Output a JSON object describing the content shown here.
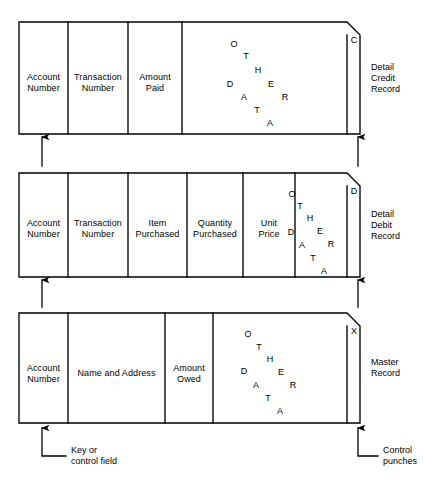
{
  "diagram": {
    "stroke_color": "#000000",
    "background_color": "#ffffff",
    "records": [
      {
        "id": "detail-credit-record",
        "side_label": "Detail\nCredit\nRecord",
        "flag_letter": "C",
        "box": {
          "x": 19,
          "y": 22,
          "width": 341,
          "height": 112,
          "corner_cut": 13
        },
        "divider_x": [
          68,
          128,
          182,
          347
        ],
        "cells": [
          {
            "name": "account-number",
            "label": "Account\nNumber",
            "cx": 43.5,
            "cy": 82
          },
          {
            "name": "transaction-number",
            "label": "Transaction\nNumber",
            "cx": 98,
            "cy": 82
          },
          {
            "name": "amount-paid",
            "label": "Amount\nPaid",
            "cx": 155,
            "cy": 82
          },
          {
            "name": "other-data",
            "label": "OTHER DATA",
            "cx": 265,
            "cy": 78
          }
        ],
        "scatter": {
          "letters": [
            {
              "ch": "O",
              "x": 234,
              "y": 44
            },
            {
              "ch": "T",
              "x": 246,
              "y": 56
            },
            {
              "ch": "H",
              "x": 258,
              "y": 70
            },
            {
              "ch": "E",
              "x": 271,
              "y": 84
            },
            {
              "ch": "R",
              "x": 285,
              "y": 97
            },
            {
              "ch": "D",
              "x": 230,
              "y": 84
            },
            {
              "ch": "A",
              "x": 244,
              "y": 97
            },
            {
              "ch": "T",
              "x": 257,
              "y": 110
            },
            {
              "ch": "A",
              "x": 270,
              "y": 123
            }
          ]
        }
      },
      {
        "id": "detail-debit-record",
        "side_label": "Detail\nDebit\nRecord",
        "flag_letter": "D",
        "box": {
          "x": 19,
          "y": 173,
          "width": 341,
          "height": 104,
          "corner_cut": 13
        },
        "divider_x": [
          68,
          128,
          187,
          243,
          295,
          347
        ],
        "cells": [
          {
            "name": "account-number",
            "label": "Account\nNumber",
            "cx": 43.5,
            "cy": 228
          },
          {
            "name": "transaction-number",
            "label": "Transaction\nNumber",
            "cx": 98,
            "cy": 228
          },
          {
            "name": "item-purchased",
            "label": "Item\nPurchased",
            "cx": 157.5,
            "cy": 228
          },
          {
            "name": "quantity-purchased",
            "label": "Quantity\nPurchased",
            "cx": 215,
            "cy": 228
          },
          {
            "name": "unit-price",
            "label": "Unit\nPrice",
            "cx": 269,
            "cy": 228
          },
          {
            "name": "other-data",
            "label": "OTHER DATA",
            "cx": 320,
            "cy": 225
          }
        ],
        "scatter": {
          "letters": [
            {
              "ch": "O",
              "x": 292,
              "y": 194
            },
            {
              "ch": "T",
              "x": 300,
              "y": 206
            },
            {
              "ch": "H",
              "x": 310,
              "y": 218
            },
            {
              "ch": "E",
              "x": 320,
              "y": 231
            },
            {
              "ch": "R",
              "x": 331,
              "y": 244
            },
            {
              "ch": "D",
              "x": 291,
              "y": 232
            },
            {
              "ch": "A",
              "x": 302,
              "y": 245
            },
            {
              "ch": "T",
              "x": 313,
              "y": 258
            },
            {
              "ch": "A",
              "x": 324,
              "y": 271
            }
          ]
        }
      },
      {
        "id": "master-record",
        "side_label": "Master\nRecord",
        "flag_letter": "X",
        "box": {
          "x": 19,
          "y": 313,
          "width": 341,
          "height": 110,
          "corner_cut": 13
        },
        "divider_x": [
          68,
          165,
          213,
          347
        ],
        "cells": [
          {
            "name": "account-number",
            "label": "Account\nNumber",
            "cx": 43.5,
            "cy": 373
          },
          {
            "name": "name-and-address",
            "label": "Name and Address",
            "cx": 116.5,
            "cy": 373
          },
          {
            "name": "amount-owed",
            "label": "Amount\nOwed",
            "cx": 189,
            "cy": 373
          },
          {
            "name": "other-data",
            "label": "OTHER DATA",
            "cx": 280,
            "cy": 371
          }
        ],
        "scatter": {
          "letters": [
            {
              "ch": "O",
              "x": 248,
              "y": 334
            },
            {
              "ch": "T",
              "x": 259,
              "y": 347
            },
            {
              "ch": "H",
              "x": 270,
              "y": 359
            },
            {
              "ch": "E",
              "x": 281,
              "y": 372
            },
            {
              "ch": "R",
              "x": 293,
              "y": 385
            },
            {
              "ch": "D",
              "x": 244,
              "y": 371
            },
            {
              "ch": "A",
              "x": 256,
              "y": 385
            },
            {
              "ch": "T",
              "x": 268,
              "y": 398
            },
            {
              "ch": "A",
              "x": 280,
              "y": 411
            }
          ]
        }
      }
    ],
    "side_labels": [
      {
        "name": "side-label-detail-credit-record",
        "lines": [
          "Detail",
          "Credit",
          "Record"
        ],
        "x": 371,
        "y": 78
      },
      {
        "name": "side-label-detail-debit-record",
        "lines": [
          "Detail",
          "Debit",
          "Record"
        ],
        "x": 371,
        "y": 225
      },
      {
        "name": "side-label-master-record",
        "lines": [
          "Master",
          "Record"
        ],
        "x": 371,
        "y": 368
      }
    ],
    "connector_arrows": [
      {
        "name": "arrow-account-number-debit-to-credit",
        "x": 42,
        "y_from": 166,
        "y_to": 137
      },
      {
        "name": "arrow-control-punch-debit-to-credit",
        "x": 358,
        "y_from": 166,
        "y_to": 137
      },
      {
        "name": "arrow-account-number-master-to-debit",
        "x": 42,
        "y_from": 307,
        "y_to": 280
      },
      {
        "name": "arrow-control-punch-master-to-debit",
        "x": 358,
        "y_from": 307,
        "y_to": 280
      }
    ],
    "callouts": [
      {
        "name": "callout-key-or-control-field",
        "lines": [
          "Key or",
          "control field"
        ],
        "arrow_x": 42,
        "arrow_top_y": 428,
        "elbow_y": 456,
        "elbow_to_x": 66,
        "text_x": 71,
        "text_y": 456
      },
      {
        "name": "callout-control-punches",
        "lines": [
          "Control",
          "punches"
        ],
        "arrow_x": 358,
        "arrow_top_y": 428,
        "elbow_y": 456,
        "elbow_to_x": 378,
        "text_x": 383,
        "text_y": 456
      }
    ]
  }
}
